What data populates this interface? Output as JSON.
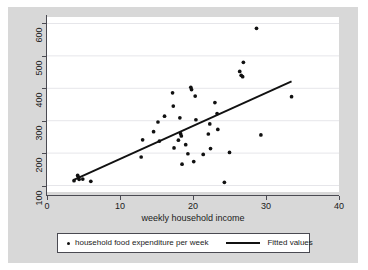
{
  "chart_data": {
    "type": "scatter",
    "title": "",
    "xlabel": "weekly household income",
    "ylabel": "",
    "xlim": [
      0,
      40
    ],
    "ylim": [
      80,
      620
    ],
    "xticks": [
      0,
      10,
      20,
      30,
      40
    ],
    "yticks": [
      100,
      200,
      300,
      400,
      500,
      600
    ],
    "grid": "horizontal",
    "legend_position": "below-plot",
    "series": [
      {
        "name": "household food expenditure per week",
        "type": "scatter",
        "marker": "circle",
        "color": "#111111",
        "points": [
          [
            3.7,
            115
          ],
          [
            4.2,
            131
          ],
          [
            4.3,
            126
          ],
          [
            4.4,
            119
          ],
          [
            4.9,
            120
          ],
          [
            6.0,
            113
          ],
          [
            12.9,
            188
          ],
          [
            13.1,
            241
          ],
          [
            14.6,
            266
          ],
          [
            15.2,
            296
          ],
          [
            15.4,
            237
          ],
          [
            16.1,
            314
          ],
          [
            17.2,
            386
          ],
          [
            17.3,
            345
          ],
          [
            17.4,
            216
          ],
          [
            18.0,
            240
          ],
          [
            18.2,
            309
          ],
          [
            18.3,
            260
          ],
          [
            18.4,
            253
          ],
          [
            18.5,
            166
          ],
          [
            19.0,
            226
          ],
          [
            19.3,
            198
          ],
          [
            19.7,
            403
          ],
          [
            19.8,
            396
          ],
          [
            20.1,
            174
          ],
          [
            20.3,
            376
          ],
          [
            20.4,
            303
          ],
          [
            21.4,
            196
          ],
          [
            22.1,
            259
          ],
          [
            22.3,
            290
          ],
          [
            22.4,
            214
          ],
          [
            23.0,
            356
          ],
          [
            23.3,
            322
          ],
          [
            23.4,
            273
          ],
          [
            24.3,
            110
          ],
          [
            25.0,
            202
          ],
          [
            26.4,
            452
          ],
          [
            26.6,
            440
          ],
          [
            26.8,
            436
          ],
          [
            26.9,
            480
          ],
          [
            28.7,
            585
          ],
          [
            29.3,
            256
          ],
          [
            33.5,
            374
          ]
        ]
      },
      {
        "name": "Fitted values",
        "type": "line",
        "color": "#111111",
        "x": [
          3.6,
          33.5
        ],
        "y": [
          117,
          421
        ],
        "slope": 10.17,
        "intercept": 80.4
      }
    ]
  },
  "axes": {
    "y_tick_labels": [
      "100",
      "200",
      "300",
      "400",
      "500",
      "600"
    ],
    "x_tick_labels": [
      "0",
      "10",
      "20",
      "30",
      "40"
    ],
    "x_axis_title": "weekly household income"
  },
  "legend": {
    "entries": [
      {
        "label": "household food expenditure per week",
        "marker": "dot-marker"
      },
      {
        "label": "Fitted values",
        "marker": "line-marker"
      }
    ]
  },
  "colors": {
    "graph_region_background": "#d8d8d8",
    "plot_background": "#ffffff",
    "axis": "#4a4a52",
    "gridline": "#e6e6ea",
    "data": "#111111"
  }
}
